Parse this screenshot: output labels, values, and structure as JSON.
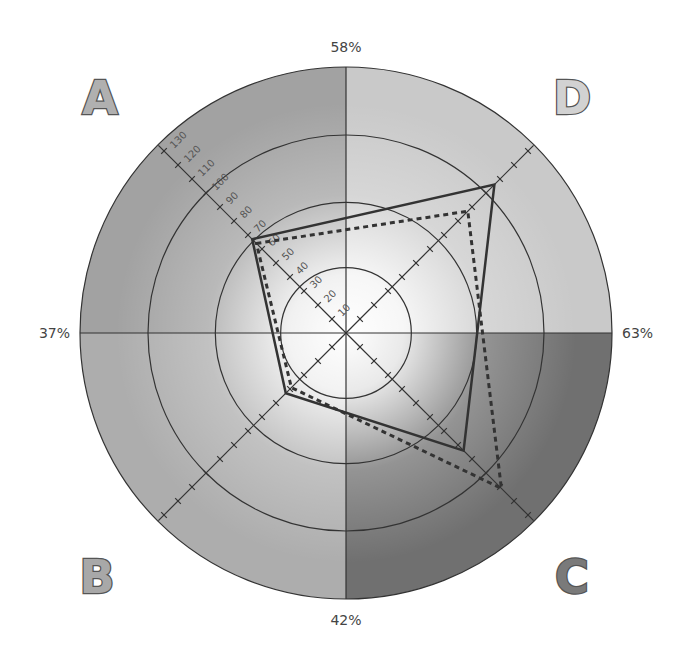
{
  "chart_data": {
    "type": "radar",
    "title": "",
    "center_px": [
      346,
      333
    ],
    "px_per_unit": 1.98,
    "outer_radius_units": 134,
    "rings_units": [
      33,
      66,
      100
    ],
    "axes": [
      {
        "name": "A",
        "angle_deg": 225
      },
      {
        "name": "D",
        "angle_deg": 315
      },
      {
        "name": "C",
        "angle_deg": 45
      },
      {
        "name": "B",
        "angle_deg": 135
      }
    ],
    "tick_labels": [
      "10",
      "20",
      "30",
      "40",
      "50",
      "60",
      "70",
      "80",
      "90",
      "100",
      "110",
      "120",
      "130"
    ],
    "tick_values": [
      10,
      20,
      30,
      40,
      50,
      60,
      70,
      80,
      90,
      100,
      110,
      120,
      130
    ],
    "quadrants": [
      {
        "label": "A",
        "position": "top-left",
        "color": "#a2a2a2",
        "letter_color": "#b0b0b0"
      },
      {
        "label": "D",
        "position": "top-right",
        "color": "#c9c9c9",
        "letter_color": "#d2d2d2"
      },
      {
        "label": "C",
        "position": "bottom-right",
        "color": "#707070",
        "letter_color": "#7a7a7a"
      },
      {
        "label": "B",
        "position": "bottom-left",
        "color": "#adadad",
        "letter_color": "#a8a8a8"
      }
    ],
    "percent_labels": {
      "top": "58%",
      "left": "37%",
      "right": "63%",
      "bottom": "42%"
    },
    "categories": [
      "A",
      "D",
      "C",
      "B"
    ],
    "series": [
      {
        "name": "solid",
        "style": "solid",
        "color": "#333333",
        "values": [
          67,
          106,
          84,
          43
        ]
      },
      {
        "name": "dashed",
        "style": "dashed",
        "color": "#333333",
        "values": [
          64,
          87,
          111,
          39
        ]
      }
    ]
  }
}
